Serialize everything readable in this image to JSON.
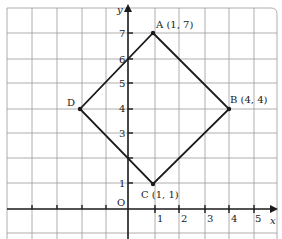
{
  "diagram": {
    "type": "coordinate-grid-quadrilateral",
    "axes": {
      "x_label": "x",
      "y_label": "y",
      "origin_label": "O",
      "x_ticks": [
        "1",
        "2",
        "3",
        "4",
        "5"
      ],
      "y_ticks": [
        "1",
        "3",
        "4",
        "5",
        "6",
        "7"
      ]
    },
    "points": [
      {
        "name": "A",
        "label": "A (1, 7)",
        "x": 1,
        "y": 7
      },
      {
        "name": "B",
        "label": "B (4, 4)",
        "x": 4,
        "y": 4
      },
      {
        "name": "C",
        "label": "C (1, 1)",
        "x": 1,
        "y": 1
      },
      {
        "name": "D",
        "label": "D",
        "x": -2,
        "y": 4
      }
    ],
    "colors": {
      "grid": "#9a9a9a",
      "axis": "#1a1a1a",
      "shape": "#1a1a1a"
    }
  }
}
